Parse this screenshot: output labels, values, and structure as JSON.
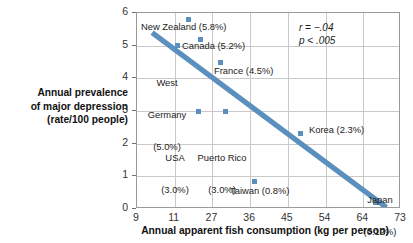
{
  "chart_data": {
    "type": "scatter",
    "title": "",
    "xlabel": "Annual apparent fish consumption (kg per person)",
    "ylabel": "Annual prevalence of major depression (rate/100 people)",
    "ylabel_lines": [
      "Annual prevalence",
      "of major depression",
      "(rate/100 people)"
    ],
    "xticks": [
      "9",
      "11",
      "27",
      "36",
      "45",
      "54",
      "64",
      "73"
    ],
    "yticks": [
      "0",
      "1",
      "2",
      "3",
      "4",
      "5",
      "6"
    ],
    "xlim": [
      9,
      73
    ],
    "ylim": [
      0,
      6
    ],
    "grid": true,
    "legend": "none",
    "accent_color": "#5b8fbe",
    "points": [
      {
        "name": "New Zealand",
        "x": 17.0,
        "y": 5.8,
        "label": "New Zealand (5.8%)",
        "value_label": "5.8%"
      },
      {
        "name": "Canada",
        "x": 22.0,
        "y": 5.2,
        "label": "Canada (5.2%)",
        "value_label": "5.2%"
      },
      {
        "name": "West Germany",
        "x": 12.0,
        "y": 5.0,
        "label": "West Germany (5.0%)",
        "value_label": "5.0%"
      },
      {
        "name": "France",
        "x": 29.0,
        "y": 4.5,
        "label": "France (4.5%)",
        "value_label": "4.5%"
      },
      {
        "name": "USA",
        "x": 21.0,
        "y": 3.0,
        "label": "USA (3.0%)",
        "value_label": "3.0%"
      },
      {
        "name": "Puerto Rico",
        "x": 30.0,
        "y": 3.0,
        "label": "Puerto Rico (3.0%)",
        "value_label": "3.0%"
      },
      {
        "name": "Korea",
        "x": 48.0,
        "y": 2.3,
        "label": "Korea (2.3%)",
        "value_label": "2.3%"
      },
      {
        "name": "Taiwan",
        "x": 37.0,
        "y": 0.85,
        "label": "Taiwan (0.8%)",
        "value_label": "0.8%"
      },
      {
        "name": "Japan",
        "x": 67.0,
        "y": 0.2,
        "label": "Japan (0.12%)",
        "value_label": "0.12%"
      }
    ],
    "trendline": {
      "from": [
        9.8,
        5.4
      ],
      "to": [
        69.5,
        0.05
      ]
    },
    "annotations": {
      "r_stat": "r = −.04",
      "p_stat": "p < .005"
    }
  },
  "point_labels": {
    "new_zealand": "New Zealand (5.8%)",
    "canada": "Canada (5.2%)",
    "west_germany_l1": "West",
    "west_germany_l2": "Germany",
    "west_germany_l3": "(5.0%)",
    "france": "France (4.5%)",
    "usa_l1": "USA",
    "usa_l2": "(3.0%)",
    "puerto_rico_l1": "Puerto Rico",
    "puerto_rico_l2": "(3.0%)",
    "korea": "Korea (2.3%)",
    "taiwan": "Taiwan (0.8%)",
    "japan_l1": "Japan",
    "japan_l2": "(0.12%)"
  }
}
